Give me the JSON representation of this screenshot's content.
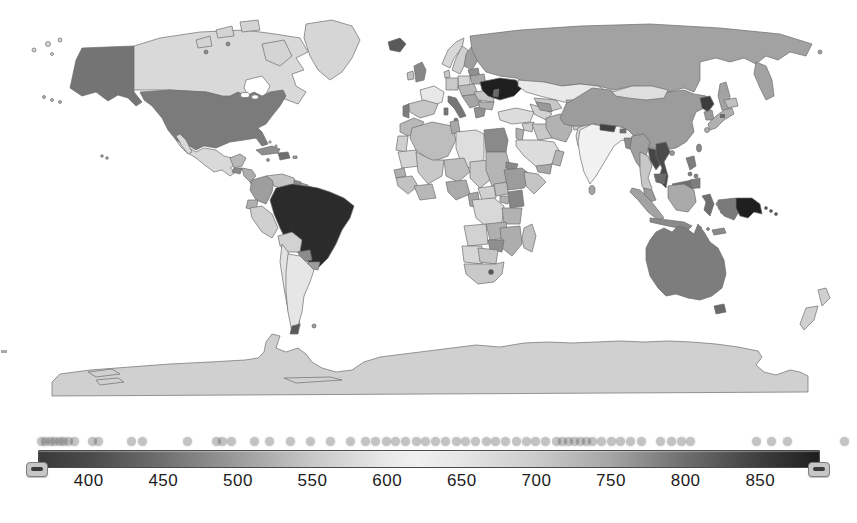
{
  "page": {
    "background": "#ffffff"
  },
  "legend": {
    "tick_labels": [
      "400",
      "450",
      "500",
      "550",
      "600",
      "650",
      "700",
      "750",
      "800",
      "850"
    ]
  },
  "chart_data": {
    "type": "choropleth",
    "projection": "world-equirectangular",
    "colorbar": {
      "orientation": "horizontal",
      "min": 366,
      "max": 890,
      "ticks": [
        400,
        450,
        500,
        550,
        600,
        650,
        700,
        750,
        800,
        850
      ],
      "gradient_stops": [
        {
          "value": 366,
          "color": "#3a3a3a"
        },
        {
          "value": 400,
          "color": "#4a4a4a"
        },
        {
          "value": 450,
          "color": "#707070"
        },
        {
          "value": 500,
          "color": "#9c9c9c"
        },
        {
          "value": 550,
          "color": "#c8c8c8"
        },
        {
          "value": 600,
          "color": "#e9e9e9"
        },
        {
          "value": 620,
          "color": "#f0f0f0"
        },
        {
          "value": 650,
          "color": "#e5e5e5"
        },
        {
          "value": 700,
          "color": "#cbcbcb"
        },
        {
          "value": 750,
          "color": "#a5a5a5"
        },
        {
          "value": 800,
          "color": "#6e6e6e"
        },
        {
          "value": 850,
          "color": "#3e3e3e"
        },
        {
          "value": 890,
          "color": "#1d1d1d"
        }
      ]
    },
    "distribution_dots": [
      368,
      371,
      374,
      377,
      380,
      383,
      386,
      390,
      402,
      406,
      428,
      436,
      466,
      485,
      489,
      495,
      511,
      521,
      535,
      548,
      562,
      575,
      585,
      592,
      599,
      605,
      612,
      619,
      625,
      632,
      639,
      646,
      652,
      659,
      666,
      672,
      679,
      686,
      693,
      699,
      706,
      713,
      717,
      721,
      725,
      729,
      733,
      737,
      743,
      750,
      756,
      763,
      770,
      783,
      790,
      797,
      803,
      847,
      857,
      868,
      906
    ],
    "regions": {
      "sea": "#ffffff",
      "alaska": "#747474",
      "usa": "#7b7b7b",
      "canada": "#d9d9d9",
      "arctic_islands": "#d4d4d4",
      "greenland": "#d6d6d6",
      "iceland": "#5a5a5a",
      "mexico": "#d9d9d9",
      "yucatan": "#b8b8b8",
      "guatemala": "#8a8a8a",
      "honduras_nicaragua": "#aeaeae",
      "costa_rica_panama": "#b5b5b5",
      "cuba": "#8e8e8e",
      "hispaniola": "#6e6e6e",
      "caribbean_small": "#9a9a9a",
      "bahamas": "#c0c0c0",
      "colombia": "#9e9e9e",
      "venezuela": "#c4c4c4",
      "guyana": "#8a8a8a",
      "suriname": "#a8a8a8",
      "french_guiana": "#b8b8b8",
      "ecuador": "#b0b0b0",
      "peru": "#d0d0d0",
      "brazil": "#2b2b2b",
      "bolivia": "#d2d2d2",
      "paraguay": "#8c8c8c",
      "uruguay": "#9e9e9e",
      "chile": "#e2e2e2",
      "argentina": "#e6e6e6",
      "patagonia_tip": "#5a5a5a",
      "falklands": "#9a9a9a",
      "uk": "#878787",
      "ireland": "#c2c2c2",
      "norway": "#d8d8d8",
      "sweden": "#d0d0d0",
      "finland": "#9e9e9e",
      "denmark": "#c8c8c8",
      "baltics": "#8f8f8f",
      "poland": "#d6d6d6",
      "germany": "#c9c9c9",
      "france": "#e8e8e8",
      "spain": "#c6c6c6",
      "portugal": "#7d7d7d",
      "italy": "#767676",
      "central_europe": "#b8b8b8",
      "balkans": "#a5a5a5",
      "greece": "#909090",
      "romania": "#c4c4c4",
      "bulgaria": "#b0b0b0",
      "belarus": "#a8a8a8",
      "ukraine": "#1f1f1f",
      "moldova": "#6a6a6a",
      "russia": "#a2a2a2",
      "kazakhstan": "#e9e9e9",
      "uzbekistan": "#c8c8c8",
      "turkmenistan": "#d2d2d2",
      "kyrgyzstan": "#b0b0b0",
      "tajikistan": "#8a8a8a",
      "caucasus": "#9a9a9a",
      "turkey": "#dcdcdc",
      "syria": "#cccccc",
      "levant": "#b0b0b0",
      "iraq": "#c8c8c8",
      "saudi_arabia": "#dcdcdc",
      "yemen": "#a8a8a8",
      "oman": "#b5b5b5",
      "iran": "#b2b2b2",
      "afghanistan": "#c9c9c9",
      "pakistan": "#dadada",
      "india": "#f1f1f1",
      "nepal": "#404040",
      "bhutan": "#707070",
      "bangladesh": "#8c8c8c",
      "sri_lanka": "#a5a5a5",
      "china": "#9c9c9c",
      "mongolia": "#dedede",
      "taiwan": "#8a8a8a",
      "hainan": "#9a9a9a",
      "north_korea": "#3c3c3c",
      "south_korea": "#9a9a9a",
      "japan": "#b0b0b0",
      "japan_dark": "#6a6a6a",
      "hokkaido": "#c0c0c0",
      "myanmar": "#a0a0a0",
      "laos": "#454545",
      "thailand": "#c8c8c8",
      "vietnam": "#4a4a4a",
      "cambodia": "#6a6a6a",
      "malaysia": "#9a9a9a",
      "north_borneo": "#6f6f6f",
      "philippines": "#7d7d7d",
      "sumatra": "#a2a2a2",
      "borneo": "#aaaaaa",
      "java": "#8a8a8a",
      "sulawesi": "#6e6e6e",
      "moluccas": "#9a9a9a",
      "timor": "#8a8a8a",
      "west_papua": "#7a7a7a",
      "papua_new_guinea": "#1f1f1f",
      "solomons": "#555555",
      "australia": "#7d7d7d",
      "tasmania": "#6a6a6a",
      "new_zealand": "#d0d0d0",
      "morocco": "#b8b8b8",
      "western_sahara": "#d0d0d0",
      "algeria": "#bdbdbd",
      "tunisia": "#a8a8a8",
      "libya": "#dedede",
      "egypt": "#8a8a8a",
      "mauritania": "#d5d5d5",
      "mali": "#c8c8c8",
      "niger": "#bdbdbd",
      "chad": "#c9c9c9",
      "sudan": "#b5b5b5",
      "senegal": "#b0b0b0",
      "guinea_region": "#c2c2c2",
      "ivory_ghana": "#b8b8b8",
      "nigeria": "#ababab",
      "cameroon": "#a5a5a5",
      "central_african_republic": "#d0d0d0",
      "south_sudan": "#bdbdbd",
      "eritrea": "#8a8a8a",
      "ethiopia": "#9c9c9c",
      "somalia": "#c5c5c5",
      "uganda": "#b0b0b0",
      "kenya": "#868686",
      "drc": "#d8d8d8",
      "tanzania": "#b2b2b2",
      "angola": "#d2d2d2",
      "zambia": "#b0b0b0",
      "mozambique": "#adadad",
      "zimbabwe": "#8f8f8f",
      "namibia": "#d6d6d6",
      "botswana": "#c6c6c6",
      "south_africa": "#c9c9c9",
      "lesotho": "#555555",
      "madagascar": "#c2c2c2",
      "antarctica": "#d0d0d0",
      "pacific_islands": "#b5b5b5",
      "hawaii": "#9a9a9a"
    }
  }
}
